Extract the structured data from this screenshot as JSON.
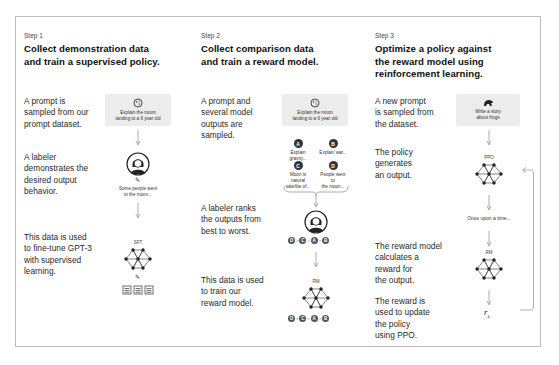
{
  "steps": [
    {
      "label": "Step 1",
      "title_line1": "Collect demonstration data",
      "title_line2": "and train a supervised policy.",
      "descriptions": [
        [
          "A prompt is",
          "sampled from our",
          "prompt dataset."
        ],
        [
          "A labeler",
          "demonstrates the",
          "desired output",
          "behavior."
        ],
        [
          "This data is used",
          "to fine-tune GPT-3",
          "with supervised",
          "learning."
        ]
      ],
      "prompt_line1": "Explain the moon",
      "prompt_line2": "landing to a 6 year old",
      "demo_output_line1": "Some people went",
      "demo_output_line2": "to the moon...",
      "model_label": "SFT"
    },
    {
      "label": "Step 2",
      "title_line1": "Collect comparison data",
      "title_line2": "and train a reward model.",
      "descriptions": [
        [
          "A prompt and",
          "several model",
          "outputs are",
          "sampled."
        ],
        [
          "A labeler ranks",
          "the outputs from",
          "best to worst."
        ],
        [
          "This data is used",
          "to train our",
          "reward model."
        ]
      ],
      "prompt_line1": "Explain the moon",
      "prompt_line2": "landing to a 6 year old",
      "outputs": [
        {
          "letter": "A",
          "line1": "Explain gravity...",
          "line2": ""
        },
        {
          "letter": "B",
          "line1": "Explain war...",
          "line2": ""
        },
        {
          "letter": "C",
          "line1": "Moon is natural",
          "line2": "satellite of..."
        },
        {
          "letter": "D",
          "line1": "People went to",
          "line2": "the moon..."
        }
      ],
      "ranking": [
        "D",
        ">",
        "C",
        ">",
        "A",
        ">",
        "B"
      ],
      "model_label": "RM"
    },
    {
      "label": "Step 3",
      "title_line1": "Optimize a policy against",
      "title_line2": "the reward model using",
      "title_line3": "reinforcement learning.",
      "descriptions": [
        [
          "A new prompt",
          "is sampled from",
          "the dataset."
        ],
        [
          "The policy",
          "generates",
          "an output."
        ],
        [
          "The reward model",
          "calculates a",
          "reward for",
          "the output."
        ],
        [
          "The reward is",
          "used to update",
          "the policy",
          "using PPO."
        ]
      ],
      "prompt_line1": "Write a story",
      "prompt_line2": "about frogs",
      "policy_label": "PPO",
      "policy_output": "Once upon a time...",
      "model_label": "RM",
      "reward_symbol": "r",
      "reward_subscript": "k"
    }
  ],
  "colors": {
    "frame_border": "#bdbdbd",
    "prompt_bg": "#ececec",
    "node": "#333333",
    "arrow": "#9a9a9a"
  }
}
